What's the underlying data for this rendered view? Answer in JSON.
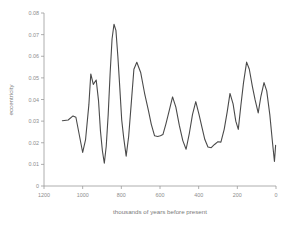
{
  "chart_data": {
    "type": "line",
    "title": "",
    "xlabel": "thousands of years before present",
    "ylabel": "eccentricity",
    "xlim": [
      1200,
      0
    ],
    "ylim": [
      0,
      0.08
    ],
    "x_reversed": true,
    "grid": false,
    "legend": null,
    "line_color": "#4a4a4a",
    "background_color": "#ffffff",
    "axis_color": "#9a9a9a",
    "tick_label_color": "#8d8d8d",
    "xticks": [
      1200,
      1000,
      800,
      600,
      400,
      200,
      0
    ],
    "xtick_labels": [
      "1200",
      "1000",
      "800",
      "600",
      "400",
      "200",
      "0"
    ],
    "yticks": [
      0,
      0.01,
      0.02,
      0.03,
      0.04,
      0.05,
      0.06,
      0.07,
      0.08
    ],
    "ytick_labels": [
      "0",
      "0.01",
      "0.02",
      "0.03",
      "0.04",
      "0.05",
      "0.06",
      "0.07",
      "0.08"
    ],
    "x": [
      1105,
      1075,
      1050,
      1035,
      1000,
      985,
      968,
      958,
      945,
      930,
      918,
      908,
      898,
      888,
      878,
      868,
      858,
      848,
      838,
      828,
      818,
      808,
      798,
      788,
      775,
      762,
      748,
      735,
      720,
      700,
      680,
      660,
      645,
      628,
      612,
      598,
      585,
      570,
      552,
      535,
      518,
      500,
      482,
      465,
      448,
      432,
      415,
      398,
      382,
      368,
      352,
      335,
      318,
      300,
      285,
      268,
      252,
      238,
      222,
      208,
      195,
      182,
      168,
      152,
      138,
      122,
      108,
      92,
      78,
      62,
      48,
      32,
      18,
      8,
      2
    ],
    "y": [
      0.0302,
      0.0305,
      0.0324,
      0.0318,
      0.0155,
      0.0215,
      0.0375,
      0.0518,
      0.047,
      0.049,
      0.0395,
      0.0255,
      0.0163,
      0.0105,
      0.0185,
      0.033,
      0.052,
      0.068,
      0.0748,
      0.072,
      0.06,
      0.0455,
      0.0305,
      0.0225,
      0.0138,
      0.023,
      0.039,
      0.054,
      0.0572,
      0.0525,
      0.043,
      0.035,
      0.0285,
      0.0232,
      0.0229,
      0.0232,
      0.0238,
      0.0285,
      0.035,
      0.0412,
      0.0365,
      0.028,
      0.021,
      0.017,
      0.0245,
      0.033,
      0.039,
      0.033,
      0.0268,
      0.0215,
      0.018,
      0.0177,
      0.0192,
      0.0205,
      0.0203,
      0.0262,
      0.0345,
      0.0428,
      0.038,
      0.03,
      0.0262,
      0.037,
      0.0478,
      0.0573,
      0.054,
      0.046,
      0.0398,
      0.0338,
      0.0415,
      0.0478,
      0.044,
      0.033,
      0.02,
      0.0113,
      0.0188
    ]
  }
}
